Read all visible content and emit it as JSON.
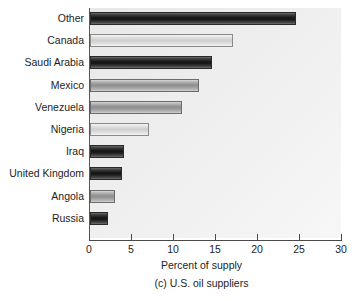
{
  "chart_data": {
    "type": "bar",
    "orientation": "horizontal",
    "title": "",
    "subtitle": "",
    "xlabel": "Percent of supply",
    "ylabel": "",
    "caption": "(c) U.S. oil suppliers",
    "xlim": [
      0,
      30
    ],
    "xticks": [
      0,
      5,
      10,
      15,
      20,
      25,
      30
    ],
    "xticklabels": [
      "0",
      "5",
      "10",
      "15",
      "20",
      "25",
      "30"
    ],
    "grid": false,
    "legend": false,
    "categories": [
      "Other",
      "Canada",
      "Saudi Arabia",
      "Mexico",
      "Venezuela",
      "Nigeria",
      "Iraq",
      "United Kingdom",
      "Angola",
      "Russia"
    ],
    "values": [
      24.5,
      17.0,
      14.5,
      13.0,
      11.0,
      7.0,
      4.0,
      3.8,
      3.0,
      2.2
    ],
    "bar_shades": [
      "dark",
      "light",
      "dark",
      "mid",
      "mid",
      "light",
      "dark",
      "dark",
      "mid",
      "dark"
    ],
    "colors": {
      "bar_dark": "#1a1a1a",
      "bar_mid": "#999999",
      "bar_light": "#dcdcdc",
      "plot_background": "#eeeeee",
      "axis": "#4a4a4a",
      "text": "#1d1d1d"
    }
  }
}
